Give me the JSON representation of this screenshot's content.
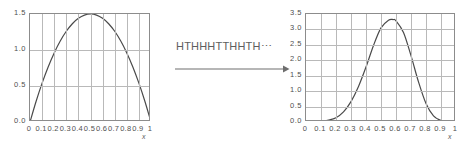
{
  "figure": {
    "name": "coin-flip-transformation-figure",
    "background": "#ffffff",
    "curve_color": "#4a4a4a",
    "grid_color": "#b9b9b9",
    "frame_color": "#8c8c8c",
    "text_color": "#555555"
  },
  "transform": {
    "sequence_label": "HTHHHTTHHTH⋯",
    "arrow_direction": "right"
  },
  "chart_data": [
    {
      "id": "left",
      "type": "line",
      "title": "",
      "xlabel": "x",
      "ylabel": "",
      "xlim": [
        0,
        1
      ],
      "ylim": [
        0,
        1.5
      ],
      "grid": true,
      "legend": "none",
      "xticks": [
        "0",
        "0.1",
        "0.2",
        "0.3",
        "0.4",
        "0.5",
        "0.6",
        "0.7",
        "0.8",
        "0.9",
        "1"
      ],
      "xtick_values": [
        0,
        0.1,
        0.2,
        0.3,
        0.4,
        0.5,
        0.6,
        0.7,
        0.8,
        0.9,
        1
      ],
      "yticks": [
        "0.0",
        "0.5",
        "1.0",
        "1.5"
      ],
      "ytick_values": [
        0.0,
        0.5,
        1.0,
        1.5
      ],
      "x": [
        0.0,
        0.05,
        0.1,
        0.15,
        0.2,
        0.25,
        0.3,
        0.35,
        0.4,
        0.45,
        0.5,
        0.55,
        0.6,
        0.65,
        0.7,
        0.75,
        0.8,
        0.85,
        0.9,
        0.95,
        1.0
      ],
      "y": [
        0.0,
        0.285,
        0.54,
        0.765,
        0.96,
        1.125,
        1.26,
        1.365,
        1.44,
        1.485,
        1.5,
        1.485,
        1.44,
        1.365,
        1.26,
        1.125,
        0.96,
        0.765,
        0.54,
        0.285,
        0.0
      ]
    },
    {
      "id": "right",
      "type": "line",
      "title": "",
      "xlabel": "x",
      "ylabel": "",
      "xlim": [
        0,
        1
      ],
      "ylim": [
        0,
        3.5
      ],
      "grid": true,
      "legend": "none",
      "xticks": [
        "0",
        "0.1",
        "0.2",
        "0.3",
        "0.4",
        "0.5",
        "0.6",
        "0.7",
        "0.8",
        "0.9",
        "1"
      ],
      "xtick_values": [
        0,
        0.1,
        0.2,
        0.3,
        0.4,
        0.5,
        0.6,
        0.7,
        0.8,
        0.9,
        1
      ],
      "yticks": [
        "0.0",
        "0.5",
        "1.0",
        "1.5",
        "2.0",
        "2.5",
        "3.0",
        "3.5"
      ],
      "ytick_values": [
        0.0,
        0.5,
        1.0,
        1.5,
        2.0,
        2.5,
        3.0,
        3.5
      ],
      "x": [
        0.0,
        0.05,
        0.1,
        0.15,
        0.2,
        0.25,
        0.3,
        0.35,
        0.4,
        0.45,
        0.5,
        0.55,
        0.58,
        0.6,
        0.65,
        0.7,
        0.75,
        0.8,
        0.85,
        0.9,
        0.95,
        1.0
      ],
      "y": [
        0.0,
        0.0,
        0.02,
        0.06,
        0.14,
        0.33,
        0.66,
        1.15,
        1.78,
        2.48,
        3.05,
        3.3,
        3.32,
        3.28,
        2.9,
        2.15,
        1.3,
        0.6,
        0.2,
        0.05,
        0.0,
        0.0
      ]
    }
  ]
}
